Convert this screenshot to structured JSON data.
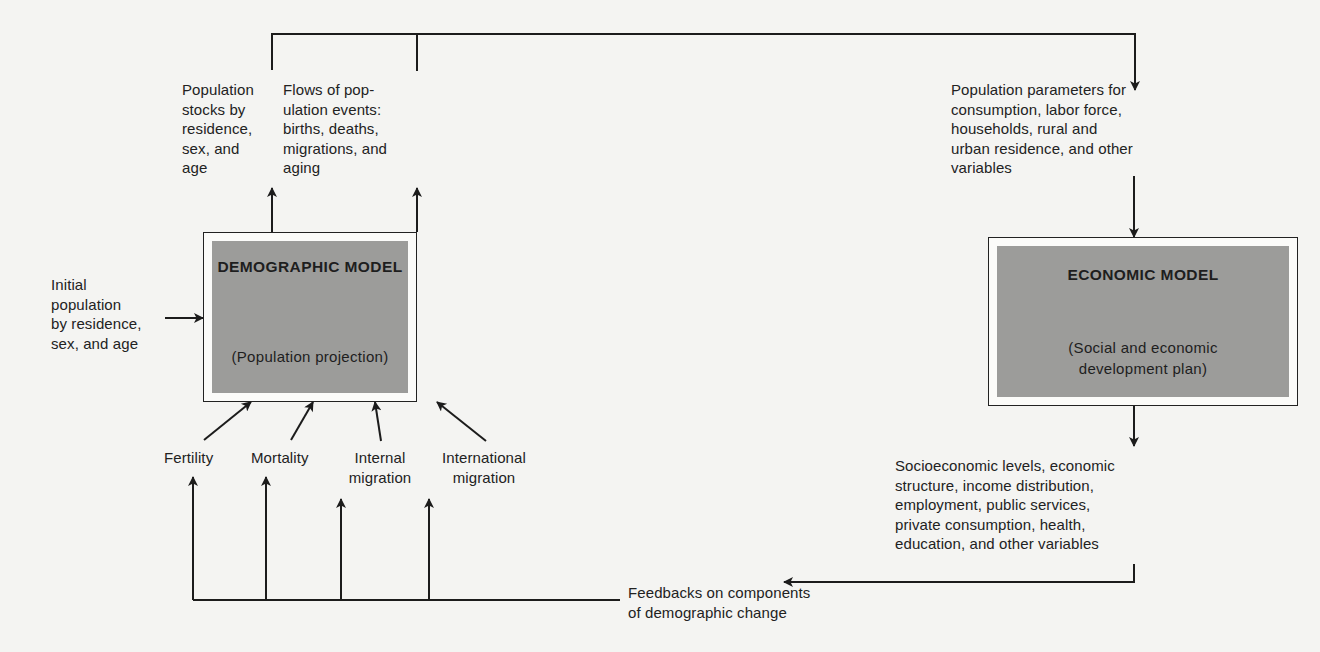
{
  "diagram": {
    "demographic_model": {
      "title": "DEMOGRAPHIC MODEL",
      "subtitle": "(Population projection)",
      "fill_color": "#9c9c9a"
    },
    "economic_model": {
      "title": "ECONOMIC MODEL",
      "subtitle_line1": "(Social and economic",
      "subtitle_line2": "development plan)",
      "fill_color": "#9c9c9a"
    },
    "initial_population": {
      "lines": [
        "Initial",
        "population",
        "by residence,",
        "sex, and age"
      ]
    },
    "outputs": {
      "population_stocks": {
        "lines": [
          "Population",
          "stocks by",
          "residence,",
          "sex, and",
          "age"
        ]
      },
      "population_flows": {
        "lines": [
          "Flows of pop-",
          "ulation events:",
          "births, deaths,",
          "migrations, and",
          "aging"
        ]
      }
    },
    "population_parameters": {
      "lines": [
        "Population parameters for",
        "consumption, labor force,",
        "households, rural and",
        "urban residence, and other",
        "variables"
      ]
    },
    "socioeconomic_outputs": {
      "lines": [
        "Socioeconomic levels, economic",
        "structure, income distribution,",
        "employment, public services,",
        "private consumption, health,",
        "education, and other variables"
      ]
    },
    "components": {
      "fertility": "Fertility",
      "mortality": "Mortality",
      "internal_migration_line1": "Internal",
      "internal_migration_line2": "migration",
      "international_migration_line1": "International",
      "international_migration_line2": "migration"
    },
    "feedback": {
      "lines": [
        "Feedbacks on components",
        "of demographic change"
      ]
    },
    "colors": {
      "line": "#1c1c1c",
      "background": "#f4f4f2",
      "box_fill": "#9c9c9a"
    }
  }
}
